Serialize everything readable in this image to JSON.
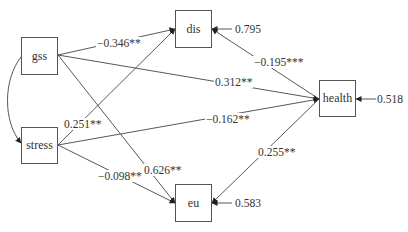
{
  "diagram": {
    "type": "path-model",
    "nodes": {
      "gss": {
        "label": "gss"
      },
      "stress": {
        "label": "stress"
      },
      "dis": {
        "label": "dis"
      },
      "eu": {
        "label": "eu"
      },
      "health": {
        "label": "health"
      }
    },
    "paths": [
      {
        "from": "gss",
        "to": "dis",
        "label": "−0.346**"
      },
      {
        "from": "gss",
        "to": "health",
        "label": "0.312**"
      },
      {
        "from": "gss",
        "to": "eu",
        "label": "0.626**"
      },
      {
        "from": "stress",
        "to": "dis",
        "label": "0.251**"
      },
      {
        "from": "stress",
        "to": "health",
        "label": "−0.162**"
      },
      {
        "from": "stress",
        "to": "eu",
        "label": "−0.098**"
      },
      {
        "from": "dis",
        "to": "health",
        "label": "−0.195***"
      },
      {
        "from": "eu",
        "to": "health",
        "label": "0.255**"
      }
    ],
    "covariances": [
      {
        "between": [
          "gss",
          "stress"
        ],
        "label": ""
      }
    ],
    "residuals": {
      "dis": "0.795",
      "health": "0.518",
      "eu": "0.583"
    }
  }
}
